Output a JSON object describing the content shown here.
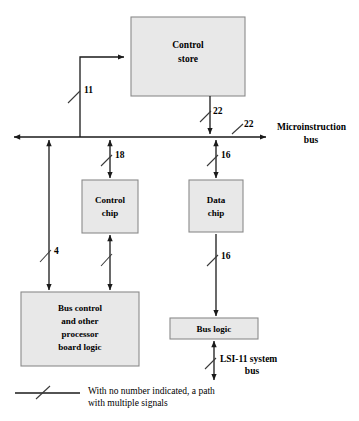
{
  "figure": {
    "type": "block-diagram"
  },
  "blocks": [
    {
      "id": "control-store",
      "line1": "Control",
      "line2": "store"
    },
    {
      "id": "control-chip",
      "line1": "Control",
      "line2": "chip"
    },
    {
      "id": "data-chip",
      "line1": "Data",
      "line2": "chip"
    },
    {
      "id": "bus-control",
      "line1": "Bus control",
      "line2": "and other",
      "line3": "processor",
      "line4": "board logic"
    },
    {
      "id": "bus-logic",
      "line1": "Bus logic"
    }
  ],
  "buses": {
    "microinstruction": {
      "line1": "Microinstruction",
      "line2": "bus"
    },
    "lsi11": {
      "line1": "LSI-11 system",
      "line2": "bus"
    }
  },
  "signal_counts": {
    "store_address": "11",
    "store_output": "22",
    "bus_right": "22",
    "control_chip": "18",
    "data_chip": "16",
    "bus_control_left": "4",
    "bus_logic": "16"
  },
  "legend": {
    "line1": "With no number indicated, a path",
    "line2": "with multiple signals"
  },
  "colors": {
    "box_fill": "#e8e8e8",
    "box_stroke": "#8a8a8a",
    "wire": "#1a1a1a",
    "text": "#000000",
    "background": "#ffffff"
  }
}
